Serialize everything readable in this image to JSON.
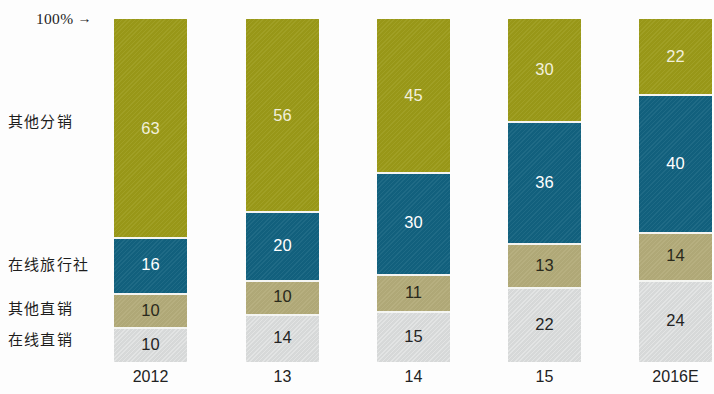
{
  "axis": {
    "top_note": "100%",
    "top_note_arrow": "→"
  },
  "categories_labels": {
    "other_distribution": "其他分销",
    "online_travel_agency": "在线旅行社",
    "other_direct": "其他直销",
    "online_direct": "在线直销"
  },
  "colors": {
    "other_distribution": "#9b9a18",
    "online_travel_agency": "#12627f",
    "other_direct": "#b3ab79",
    "online_direct": "#d9dbdb"
  },
  "chart_data": {
    "type": "bar",
    "title": "",
    "subtitle": "",
    "xlabel": "",
    "ylabel": "",
    "stacked": true,
    "normalized_percent": true,
    "grid": false,
    "legend_position": "left",
    "ylim": [
      0,
      100
    ],
    "axis_annotation": "100% →",
    "categories": [
      "2012",
      "13",
      "14",
      "15",
      "2016E"
    ],
    "series": [
      {
        "name": "其他分销",
        "color": "#9b9a18",
        "values": [
          63,
          56,
          45,
          30,
          22
        ]
      },
      {
        "name": "在线旅行社",
        "color": "#12627f",
        "values": [
          16,
          20,
          30,
          36,
          40
        ]
      },
      {
        "name": "其他直销",
        "color": "#b3ab79",
        "values": [
          10,
          10,
          11,
          13,
          14
        ]
      },
      {
        "name": "在线直销",
        "color": "#d9dbdb",
        "values": [
          10,
          14,
          15,
          22,
          24
        ]
      }
    ],
    "bars": [
      {
        "category": "2012",
        "segments": [
          {
            "name": "其他分销",
            "value": 63,
            "label": "63"
          },
          {
            "name": "在线旅行社",
            "value": 16,
            "label": "16"
          },
          {
            "name": "其他直销",
            "value": 10,
            "label": "10"
          },
          {
            "name": "在线直销",
            "value": 10,
            "label": "10"
          }
        ]
      },
      {
        "category": "13",
        "segments": [
          {
            "name": "其他分销",
            "value": 56,
            "label": "56"
          },
          {
            "name": "在线旅行社",
            "value": 20,
            "label": "20"
          },
          {
            "name": "其他直销",
            "value": 10,
            "label": "10"
          },
          {
            "name": "在线直销",
            "value": 14,
            "label": "14"
          }
        ]
      },
      {
        "category": "14",
        "segments": [
          {
            "name": "其他分销",
            "value": 45,
            "label": "45"
          },
          {
            "name": "在线旅行社",
            "value": 30,
            "label": "30"
          },
          {
            "name": "其他直销",
            "value": 11,
            "label": "11"
          },
          {
            "name": "在线直销",
            "value": 15,
            "label": "15"
          }
        ]
      },
      {
        "category": "15",
        "segments": [
          {
            "name": "其他分销",
            "value": 30,
            "label": "30"
          },
          {
            "name": "在线旅行社",
            "value": 36,
            "label": "36"
          },
          {
            "name": "其他直销",
            "value": 13,
            "label": "13"
          },
          {
            "name": "在线直销",
            "value": 22,
            "label": "22"
          }
        ]
      },
      {
        "category": "2016E",
        "segments": [
          {
            "name": "其他分销",
            "value": 22,
            "label": "22"
          },
          {
            "name": "在线旅行社",
            "value": 40,
            "label": "40"
          },
          {
            "name": "其他直销",
            "value": 14,
            "label": "14"
          },
          {
            "name": "在线直销",
            "value": 24,
            "label": "24"
          }
        ]
      }
    ]
  },
  "layout": {
    "bar_left_positions": [
      114,
      246,
      377,
      508,
      639
    ],
    "bar_width": 73,
    "plot_top": 19,
    "plot_height": 343
  }
}
